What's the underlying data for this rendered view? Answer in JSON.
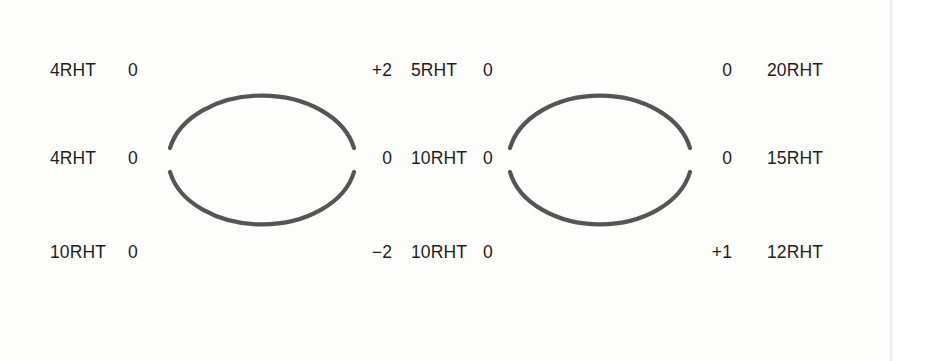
{
  "document": {
    "type": "scanned-diagram-sheet",
    "background_color": "#fdfdfc",
    "ink_color": "#1d1d1d",
    "arc_color": "#555555"
  },
  "diagrams": [
    {
      "name": "left-arch-diagram",
      "center_x": 262,
      "center_y": 159,
      "rx": 94,
      "ry": 66,
      "rows": [
        {
          "left_code": "4RHT",
          "left_value": "0",
          "right_value": "+2",
          "right_code": "5RHT"
        },
        {
          "left_code": "4RHT",
          "left_value": "0",
          "right_value": "0",
          "right_code": "10RHT"
        },
        {
          "left_code": "10RHT",
          "left_value": "0",
          "right_value": "−2",
          "right_code": "10RHT"
        }
      ]
    },
    {
      "name": "right-arch-diagram",
      "center_x": 600,
      "center_y": 159,
      "rx": 92,
      "ry": 66,
      "rows": [
        {
          "left_code": "5RHT",
          "left_value": "0",
          "right_value": "0",
          "right_code": "20RHT"
        },
        {
          "left_code": "10RHT",
          "left_value": "0",
          "right_value": "0",
          "right_code": "15RHT"
        },
        {
          "left_code": "10RHT",
          "left_value": "0",
          "right_value": "+1",
          "right_code": "12RHT"
        }
      ]
    }
  ]
}
